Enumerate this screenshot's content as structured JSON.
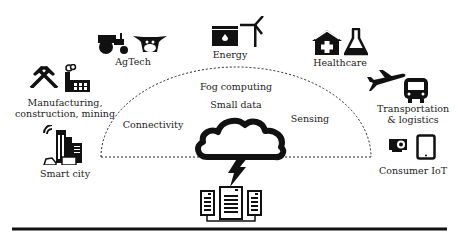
{
  "diagram": {
    "colors": {
      "ink": "#111111",
      "background": "#ffffff"
    },
    "arc_labels": {
      "fog_computing": "Fog computing",
      "small_data": "Small data",
      "connectivity": "Connectivity",
      "sensing": "Sensing"
    },
    "domains": [
      {
        "id": "agtech",
        "label": "AgTech",
        "icons": [
          "tractor-icon",
          "cow-icon"
        ]
      },
      {
        "id": "energy",
        "label": "Energy",
        "icons": [
          "oil-tank-icon",
          "wind-turbine-icon"
        ]
      },
      {
        "id": "healthcare",
        "label": "Healthcare",
        "icons": [
          "hospital-icon",
          "flask-icon"
        ]
      },
      {
        "id": "manufacturing",
        "label_line1": "Manufacturing,",
        "label_line2": "construction, mining",
        "icons": [
          "crossed-hammers-icon",
          "factory-icon"
        ]
      },
      {
        "id": "transportation",
        "label_line1": "Transportation",
        "label_line2": "& logistics",
        "icons": [
          "airplane-icon",
          "bus-icon"
        ]
      },
      {
        "id": "smart_city",
        "label": "Smart city",
        "icons": [
          "city-buildings-wifi-icon"
        ]
      },
      {
        "id": "consumer_iot",
        "label": "Consumer IoT",
        "icons": [
          "action-camera-icon",
          "tablet-icon"
        ]
      }
    ],
    "center": {
      "icons": [
        "cloud-icon",
        "lightning-icon",
        "servers-icon"
      ]
    }
  }
}
